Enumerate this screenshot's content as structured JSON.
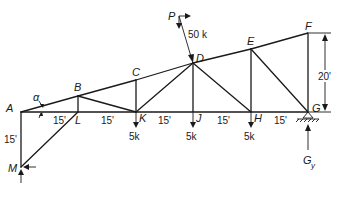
{
  "diagram": {
    "type": "truss",
    "nodes": {
      "A": {
        "label": "A"
      },
      "B": {
        "label": "B"
      },
      "C": {
        "label": "C"
      },
      "D": {
        "label": "D"
      },
      "E": {
        "label": "E"
      },
      "F": {
        "label": "F"
      },
      "G": {
        "label": "G"
      },
      "H": {
        "label": "H"
      },
      "J": {
        "label": "J"
      },
      "K": {
        "label": "K"
      },
      "L": {
        "label": "L"
      },
      "M": {
        "label": "M"
      }
    },
    "members": [
      [
        "A",
        "B"
      ],
      [
        "B",
        "C"
      ],
      [
        "C",
        "D"
      ],
      [
        "D",
        "E"
      ],
      [
        "E",
        "F"
      ],
      [
        "A",
        "L"
      ],
      [
        "L",
        "K"
      ],
      [
        "K",
        "J"
      ],
      [
        "J",
        "H"
      ],
      [
        "H",
        "G"
      ],
      [
        "F",
        "G"
      ],
      [
        "B",
        "L"
      ],
      [
        "C",
        "K"
      ],
      [
        "D",
        "J"
      ],
      [
        "E",
        "H"
      ],
      [
        "B",
        "K"
      ],
      [
        "K",
        "D"
      ],
      [
        "D",
        "H"
      ],
      [
        "E",
        "G"
      ],
      [
        "A",
        "M"
      ],
      [
        "L",
        "M"
      ]
    ],
    "dimensions": {
      "panel": "15'",
      "height_FG": "20'",
      "height_AM": "15'",
      "angle": "α"
    },
    "loads": {
      "P_label": "P",
      "P_value": "50 k",
      "K_load": "5k",
      "J_load": "5k",
      "H_load": "5k"
    },
    "reactions": {
      "G": "G",
      "G_sub": "y"
    }
  }
}
